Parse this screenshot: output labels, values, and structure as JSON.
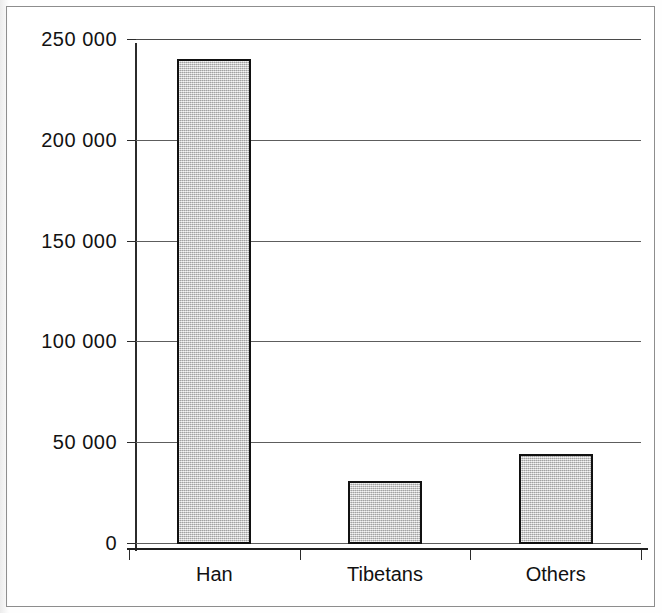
{
  "chart_data": {
    "type": "bar",
    "title": "",
    "subtitle": "",
    "xlabel": "",
    "ylabel": "",
    "categories": [
      "Han",
      "Tibetans",
      "Others"
    ],
    "values": [
      240000,
      31000,
      44000
    ],
    "ylim": [
      0,
      250000
    ],
    "ytick_values": [
      0,
      50000,
      100000,
      150000,
      200000,
      250000
    ],
    "ytick_labels": [
      "0",
      "50 000",
      "100 000",
      "150 000",
      "200 000",
      "250 000"
    ],
    "grid": "horizontal",
    "legend": "none",
    "bar_fill_color": "#cfcfcf",
    "bar_border_color": "#111111",
    "axis_color": "#1f1f1f",
    "gridline_color": "#5d5d5d",
    "background_color": "#ffffff"
  },
  "figure": {
    "frame_border_color": "#8d8d8d",
    "caption": ""
  }
}
